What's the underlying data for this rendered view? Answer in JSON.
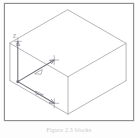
{
  "figure": {
    "caption": "Figure 2.3    blocks",
    "frame": {
      "border_color": "#8f8f8f",
      "background": "#ffffff"
    },
    "drawing": {
      "type": "isometric-wireframe-box",
      "line_color": "#9a9aa2",
      "dimension_color": "#6e6e76",
      "description": "Wireframe rectangular box drawn in isometric projection with dimension arrows on the near-left corner"
    },
    "axes": [
      {
        "id": "z",
        "label": "Z",
        "direction": "up",
        "arrow": "triangle"
      },
      {
        "id": "y",
        "label": "Y",
        "direction": "upper-right",
        "arrow": "triangle"
      },
      {
        "id": "x",
        "label": "X",
        "direction": "lower-right",
        "arrow": "triangle"
      }
    ],
    "markers": [
      {
        "id": "tick-y",
        "glyph": "cross-tick"
      },
      {
        "id": "tick-x",
        "glyph": "cross-tick"
      },
      {
        "id": "tick-origin",
        "glyph": "cross-tick"
      }
    ]
  }
}
